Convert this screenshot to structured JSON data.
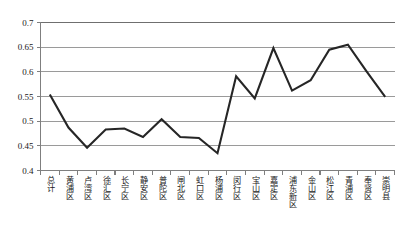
{
  "chart_data": {
    "type": "line",
    "title": "",
    "subtitle": "",
    "xlabel": "",
    "ylabel": "",
    "grid": true,
    "legend": false,
    "legend_position": "none",
    "ylim": [
      0.4,
      0.7
    ],
    "ytick_labels": [
      "0.7",
      "0.65",
      "0.6",
      "0.55",
      "0.5",
      "0.45",
      "0.4"
    ],
    "ytick_values": [
      0.7,
      0.65,
      0.6,
      0.55,
      0.5,
      0.45,
      0.4
    ],
    "categories": [
      "总计",
      "黄浦区",
      "卢湾区",
      "徐汇区",
      "长宁区",
      "静安区",
      "普陀区",
      "闸北区",
      "虹口区",
      "杨浦区",
      "闵行区",
      "宝山区",
      "嘉定区",
      "浦东新区",
      "金山区",
      "松江区",
      "青浦区",
      "奉贤区",
      "崇明县"
    ],
    "values": [
      0.554,
      0.487,
      0.446,
      0.483,
      0.485,
      0.468,
      0.504,
      0.468,
      0.466,
      0.435,
      0.591,
      0.546,
      0.648,
      0.562,
      0.583,
      0.645,
      0.655,
      0.601,
      0.549
    ],
    "series": [
      {
        "name": "series-1",
        "values": [
          0.554,
          0.487,
          0.446,
          0.483,
          0.485,
          0.468,
          0.504,
          0.468,
          0.466,
          0.435,
          0.591,
          0.546,
          0.648,
          0.562,
          0.583,
          0.645,
          0.655,
          0.601,
          0.549
        ]
      }
    ],
    "colors": {
      "line": "#262626",
      "grid": "#9a9a9a",
      "axis": "#7f7f7f",
      "background": "#ffffff",
      "text": "#1a1a1a"
    }
  }
}
